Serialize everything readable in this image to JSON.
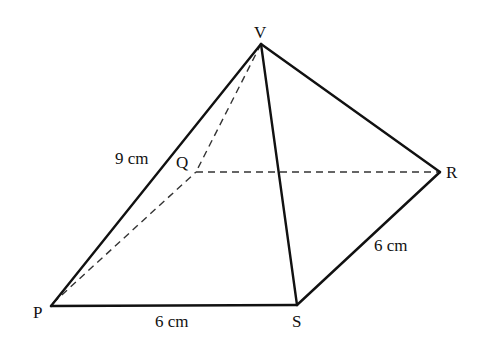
{
  "diagram": {
    "type": "square-based pyramid",
    "vertices": {
      "V": {
        "label": "V",
        "x": 261,
        "y": 44
      },
      "P": {
        "label": "P",
        "x": 51,
        "y": 306
      },
      "Q": {
        "label": "Q",
        "x": 196,
        "y": 172
      },
      "R": {
        "label": "R",
        "x": 440,
        "y": 172
      },
      "S": {
        "label": "S",
        "x": 297,
        "y": 305
      }
    },
    "visible_edges": [
      "VP",
      "VS",
      "VR",
      "PS",
      "SR"
    ],
    "hidden_edges": [
      "VQ",
      "PQ",
      "QR"
    ],
    "measurements": {
      "VP": "9 cm",
      "PS": "6 cm",
      "SR": "6 cm"
    }
  }
}
